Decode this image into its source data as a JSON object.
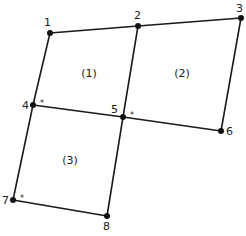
{
  "diagram": {
    "title": "",
    "nodes": [
      {
        "id": "1",
        "label": "1",
        "x": 50,
        "y": 33,
        "lx": 44,
        "ly": 26
      },
      {
        "id": "2",
        "label": "2",
        "x": 138,
        "y": 26,
        "lx": 134,
        "ly": 19
      },
      {
        "id": "3",
        "label": "3",
        "x": 241,
        "y": 18,
        "lx": 236,
        "ly": 12
      },
      {
        "id": "4",
        "label": "4",
        "x": 33,
        "y": 105,
        "lx": 22,
        "ly": 109
      },
      {
        "id": "5",
        "label": "5",
        "x": 123,
        "y": 117,
        "lx": 111,
        "ly": 113
      },
      {
        "id": "6",
        "label": "6",
        "x": 221,
        "y": 131,
        "lx": 226,
        "ly": 135
      },
      {
        "id": "7",
        "label": "7",
        "x": 13,
        "y": 200,
        "lx": 2,
        "ly": 204
      },
      {
        "id": "8",
        "label": "8",
        "x": 107,
        "y": 216,
        "lx": 103,
        "ly": 230
      }
    ],
    "edges": [
      [
        "1",
        "2"
      ],
      [
        "2",
        "3"
      ],
      [
        "1",
        "4"
      ],
      [
        "2",
        "5"
      ],
      [
        "3",
        "6"
      ],
      [
        "4",
        "5"
      ],
      [
        "5",
        "6"
      ],
      [
        "4",
        "7"
      ],
      [
        "5",
        "8"
      ],
      [
        "7",
        "8"
      ]
    ],
    "elements": [
      {
        "id": "1",
        "label": "(1)",
        "x": 89,
        "y": 77
      },
      {
        "id": "2",
        "label": "(2)",
        "x": 182,
        "y": 77
      },
      {
        "id": "3",
        "label": "(3)",
        "x": 70,
        "y": 164
      }
    ],
    "star_markers": [
      {
        "node": "4",
        "label": "*",
        "x": 40,
        "y": 106
      },
      {
        "node": "5",
        "label": "*",
        "x": 130,
        "y": 118
      },
      {
        "node": "7",
        "label": "*",
        "x": 20,
        "y": 201
      }
    ],
    "colors": {
      "line": "#1a1a1a",
      "node": "#111111",
      "background": "#ffffff"
    }
  }
}
